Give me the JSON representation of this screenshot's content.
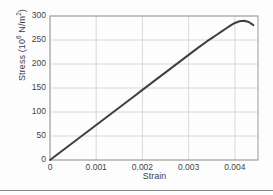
{
  "chart_data": {
    "type": "line",
    "title": "",
    "xlabel": "Strain",
    "ylabel": "Stress (10⁶ N/m²)",
    "ylabel_base": "Stress (10",
    "ylabel_exp": "6",
    "ylabel_tail": " N/m",
    "ylabel_exp2": "2",
    "ylabel_close": ")",
    "xlim": [
      0,
      0.0045
    ],
    "ylim": [
      0,
      300
    ],
    "xticks": [
      0,
      0.001,
      0.002,
      0.003,
      0.004
    ],
    "xticklabels": [
      "0",
      "0.001",
      "0.002",
      "0.003",
      "0.004"
    ],
    "yticks": [
      0,
      50,
      100,
      150,
      200,
      250,
      300
    ],
    "yticklabels": [
      "0",
      "50",
      "100",
      "150",
      "200",
      "250",
      "300"
    ],
    "grid": true,
    "legend": "none",
    "series": [
      {
        "name": "stress-strain",
        "color": "#3f3f3f",
        "linewidth": 2,
        "x": [
          0,
          0.0002,
          0.0004,
          0.0006,
          0.0008,
          0.001,
          0.0012,
          0.0014,
          0.0016,
          0.0018,
          0.002,
          0.0022,
          0.0024,
          0.0026,
          0.0028,
          0.003,
          0.0032,
          0.0034,
          0.0035,
          0.0036,
          0.0037,
          0.0038,
          0.0039,
          0.004,
          0.0041,
          0.0042,
          0.0043,
          0.0044
        ],
        "y": [
          0,
          14.6,
          29.2,
          43.8,
          58.4,
          73,
          87.6,
          102.2,
          116.8,
          131.4,
          146,
          160.6,
          175.2,
          189.8,
          204.4,
          219,
          233.5,
          247.5,
          254,
          260.5,
          267,
          273.5,
          280,
          285.5,
          289,
          290,
          287.5,
          281
        ]
      }
    ],
    "annotations": {
      "peak_stress": 290,
      "peak_strain": 0.0042,
      "linear_modulus_note": "",
      "final_point": [
        0.0044,
        281
      ]
    },
    "style": {
      "grid_color": "#d8d8d8",
      "frame_color": "#9a9a9a",
      "background": "#fdfdfd",
      "text_color": "#3f3f3f",
      "bottom_rule_color": "#8a8a8a"
    }
  }
}
